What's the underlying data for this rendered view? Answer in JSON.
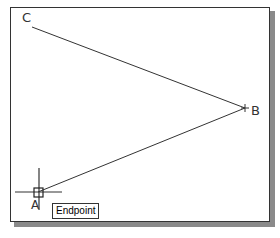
{
  "drawing": {
    "points": {
      "A": {
        "label": "A",
        "x": 38,
        "y": 192
      },
      "B": {
        "label": "B",
        "x": 245,
        "y": 108
      },
      "C": {
        "label": "C",
        "x": 32,
        "y": 27
      }
    },
    "lines": [
      {
        "from": "C",
        "to": "B"
      },
      {
        "from": "B",
        "to": "A"
      }
    ],
    "line_color": "#333333"
  },
  "cursor": {
    "type": "crosshair",
    "snap_marker": "endpoint-square",
    "x": 38,
    "y": 192
  },
  "tooltip": {
    "label": "Endpoint"
  }
}
